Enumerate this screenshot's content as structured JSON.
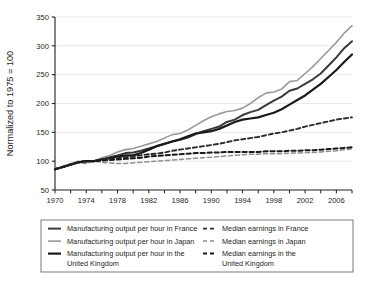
{
  "chart_data": {
    "type": "line",
    "title": "",
    "xlabel": "",
    "ylabel": "Normalized to 1975 = 100",
    "xlim": [
      1970,
      2008
    ],
    "ylim": [
      50,
      350
    ],
    "yticks": [
      50,
      100,
      150,
      200,
      250,
      300,
      350
    ],
    "xticks": [
      1970,
      1974,
      1978,
      1982,
      1986,
      1990,
      1994,
      1998,
      2002,
      2006
    ],
    "xtick_minor_step": 2,
    "grid": "horizontal",
    "legend_position": "below",
    "x": [
      1970,
      1971,
      1972,
      1973,
      1974,
      1975,
      1976,
      1977,
      1978,
      1979,
      1980,
      1981,
      1982,
      1983,
      1984,
      1985,
      1986,
      1987,
      1988,
      1989,
      1990,
      1991,
      1992,
      1993,
      1994,
      1995,
      1996,
      1997,
      1998,
      1999,
      2000,
      2001,
      2002,
      2003,
      2004,
      2005,
      2006,
      2007,
      2008
    ],
    "series": [
      {
        "name": "Manufacturing output per hour in France",
        "style": "solid",
        "color": "#3a3a3a",
        "width": 2.0,
        "values": [
          86,
          90,
          94,
          98,
          100,
          100,
          104,
          107,
          110,
          114,
          115,
          118,
          122,
          126,
          130,
          134,
          137,
          141,
          147,
          152,
          156,
          160,
          168,
          172,
          180,
          185,
          189,
          197,
          205,
          212,
          222,
          226,
          234,
          242,
          252,
          266,
          280,
          296,
          308
        ]
      },
      {
        "name": "Manufacturing output per hour in Japan",
        "style": "solid",
        "color": "#9b9b9b",
        "width": 1.6,
        "values": [
          86,
          91,
          96,
          100,
          98,
          100,
          106,
          110,
          116,
          120,
          122,
          126,
          130,
          134,
          140,
          146,
          148,
          154,
          162,
          170,
          177,
          182,
          186,
          188,
          192,
          200,
          210,
          218,
          220,
          225,
          238,
          240,
          252,
          264,
          278,
          292,
          306,
          322,
          335
        ]
      },
      {
        "name": "Manufacturing output per hour in the United Kingdom",
        "style": "solid",
        "color": "#1a1a1a",
        "width": 2.2,
        "values": [
          86,
          90,
          94,
          98,
          100,
          100,
          103,
          105,
          108,
          110,
          110,
          114,
          120,
          126,
          130,
          134,
          138,
          143,
          148,
          150,
          152,
          156,
          162,
          168,
          172,
          174,
          176,
          180,
          184,
          190,
          198,
          206,
          214,
          224,
          234,
          246,
          258,
          272,
          285
        ]
      },
      {
        "name": "Median earnings in France",
        "style": "dashed",
        "color": "#2b2b2b",
        "width": 1.9,
        "values": [
          86,
          90,
          94,
          98,
          100,
          100,
          103,
          104,
          105,
          107,
          108,
          110,
          112,
          113,
          115,
          118,
          120,
          122,
          124,
          126,
          128,
          130,
          133,
          136,
          138,
          140,
          142,
          145,
          148,
          150,
          153,
          156,
          160,
          163,
          166,
          169,
          172,
          174,
          176
        ]
      },
      {
        "name": "Median earnings in Japan",
        "style": "dashed",
        "color": "#8f8f8f",
        "width": 1.5,
        "values": [
          86,
          90,
          94,
          97,
          96,
          100,
          98,
          97,
          96,
          96,
          97,
          98,
          99,
          100,
          101,
          102,
          103,
          104,
          105,
          106,
          107,
          108,
          109,
          110,
          111,
          112,
          112,
          113,
          113,
          113,
          114,
          114,
          115,
          115,
          116,
          117,
          118,
          120,
          121
        ]
      },
      {
        "name": "Median earnings in the United Kingdom",
        "style": "dashed",
        "color": "#1a1a1a",
        "width": 2.0,
        "values": [
          86,
          90,
          94,
          98,
          100,
          100,
          101,
          102,
          103,
          104,
          105,
          106,
          108,
          109,
          110,
          111,
          112,
          113,
          114,
          114,
          115,
          115,
          116,
          116,
          116,
          116,
          116,
          117,
          117,
          117,
          118,
          118,
          119,
          119,
          120,
          121,
          122,
          123,
          124
        ]
      }
    ]
  },
  "legend": {
    "items": [
      {
        "label": "Manufacturing output per hour in France",
        "style": "solid",
        "color": "#3a3a3a",
        "width": 2.0,
        "column": 0,
        "row": 0
      },
      {
        "label": "Manufacturing output per hour in Japan",
        "style": "solid",
        "color": "#9b9b9b",
        "width": 1.6,
        "column": 0,
        "row": 1
      },
      {
        "label": "Manufacturing output per hour in the United Kingdom",
        "style": "solid",
        "color": "#1a1a1a",
        "width": 2.2,
        "column": 0,
        "row": 2
      },
      {
        "label": "Median earnings in France",
        "style": "dashed",
        "color": "#2b2b2b",
        "width": 1.9,
        "column": 1,
        "row": 0
      },
      {
        "label": "Median earnings in Japan",
        "style": "dashed",
        "color": "#8f8f8f",
        "width": 1.5,
        "column": 1,
        "row": 1
      },
      {
        "label": "Median earnings in the United Kingdom",
        "style": "dashed",
        "color": "#1a1a1a",
        "width": 2.0,
        "column": 1,
        "row": 2
      }
    ]
  },
  "colors": {
    "axis": "#231f20",
    "grid": "#e3e3e3",
    "background": "#ffffff",
    "legend_border": "#6d6d6d"
  }
}
